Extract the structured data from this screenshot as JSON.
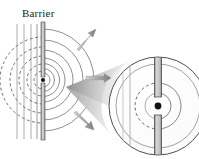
{
  "figure": {
    "title_label": "Barrier",
    "width": 199,
    "height": 159,
    "background": "#ffffff",
    "description_type": "wave-diffraction-through-slit"
  },
  "labels": {
    "barrier": "Barrier"
  },
  "colors": {
    "stroke_dark": "#3a3a3a",
    "stroke_mid": "#6e6e6e",
    "stroke_light": "#a8a8a8",
    "barrier_fill": "#c9c9c9",
    "cone_light": "#f2f2f2",
    "cone_dark": "#8c8c8c",
    "dot_fill": "#111111",
    "text": "#1c1c1c",
    "arrow_fill": "#9a9a9a"
  },
  "main_diagram": {
    "name": "wave-diffraction-main",
    "source_point": {
      "x": 43,
      "y": 80,
      "radius": 2.0
    },
    "barrier": {
      "x": 43,
      "y_top": 22,
      "y_bottom": 140,
      "thickness": 4.0,
      "gap_half_height": 3.5
    },
    "incoming_wavefronts": {
      "type": "vertical-lines",
      "x_positions": [
        17,
        24,
        31,
        37
      ],
      "y_top": 24,
      "y_bottom": 139,
      "stroke": "#9c9c9c",
      "stroke_width": 0.9
    },
    "reflected_arcs_dashed": {
      "side": "left",
      "radii": [
        9,
        16,
        24,
        33,
        43
      ],
      "stroke": "#555555",
      "dash": "3,2.4"
    },
    "transmitted_arcs_solid": {
      "side": "right",
      "radii": [
        7,
        11.5,
        16.5,
        22,
        30,
        40,
        51
      ],
      "stroke": "#777777"
    }
  },
  "arrows": [
    {
      "name": "arrow-upper-right",
      "from": {
        "x": 78,
        "y": 48
      },
      "to": {
        "x": 94,
        "y": 30
      },
      "direction": "up-right"
    },
    {
      "name": "arrow-middle-right",
      "from": {
        "x": 86,
        "y": 78
      },
      "to": {
        "x": 110,
        "y": 78
      },
      "direction": "right"
    },
    {
      "name": "arrow-lower-right",
      "from": {
        "x": 76,
        "y": 112
      },
      "to": {
        "x": 92,
        "y": 129
      },
      "direction": "down-right"
    }
  ],
  "magnifier": {
    "name": "magnified-inset",
    "cone": {
      "apex": {
        "x": 66,
        "y": 87
      },
      "description": "shaded cone linking slit to magnified circle"
    },
    "circle": {
      "cx": 158,
      "cy": 106,
      "r": 49
    },
    "inner_ring": {
      "cx": 158,
      "cy": 106,
      "r": 42
    },
    "source_point": {
      "x": 158,
      "y": 106,
      "radius": 3.4
    },
    "barrier": {
      "x": 158,
      "y_top": 61,
      "y_bottom": 152,
      "thickness": 7.0,
      "gap_half_height": 9.0
    },
    "dashed_arc": {
      "radius": 23,
      "side": "left",
      "dash": "3,2.6"
    },
    "solid_arcs": {
      "radii": [
        13,
        23,
        42
      ],
      "side": "right"
    },
    "vertical_guide_lines": {
      "x_positions": [
        130,
        124
      ],
      "stroke": "#9a9a9a"
    }
  }
}
